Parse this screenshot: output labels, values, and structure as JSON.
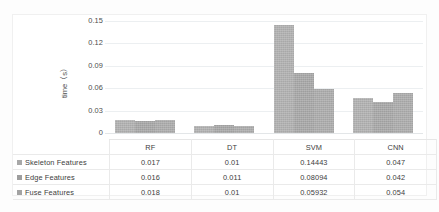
{
  "chart_data": {
    "type": "bar",
    "title": "",
    "xlabel": "",
    "ylabel": "time（s）",
    "ylim": [
      0,
      0.15
    ],
    "yticks": [
      "0",
      "0.03",
      "0.06",
      "0.09",
      "0.12",
      "0.15"
    ],
    "ytick_values": [
      0,
      0.03,
      0.06,
      0.09,
      0.12,
      0.15
    ],
    "grid": true,
    "legend_position": "table-below",
    "categories": [
      "RF",
      "DT",
      "SVM",
      "CNN"
    ],
    "series": [
      {
        "name": "Skeleton Features",
        "color": "#a8a8a8",
        "values": [
          0.017,
          0.01,
          0.14443,
          0.047
        ],
        "labels": [
          "0.017",
          "0.01",
          "0.14443",
          "0.047"
        ]
      },
      {
        "name": "Edge Features",
        "color": "#9e9e9e",
        "values": [
          0.016,
          0.011,
          0.08094,
          0.042
        ],
        "labels": [
          "0.016",
          "0.011",
          "0.08094",
          "0.042"
        ]
      },
      {
        "name": "Fuse Features",
        "color": "#a3a3a3",
        "values": [
          0.018,
          0.01,
          0.05932,
          0.054
        ],
        "labels": [
          "0.018",
          "0.01",
          "0.05932",
          "0.054"
        ]
      }
    ]
  }
}
